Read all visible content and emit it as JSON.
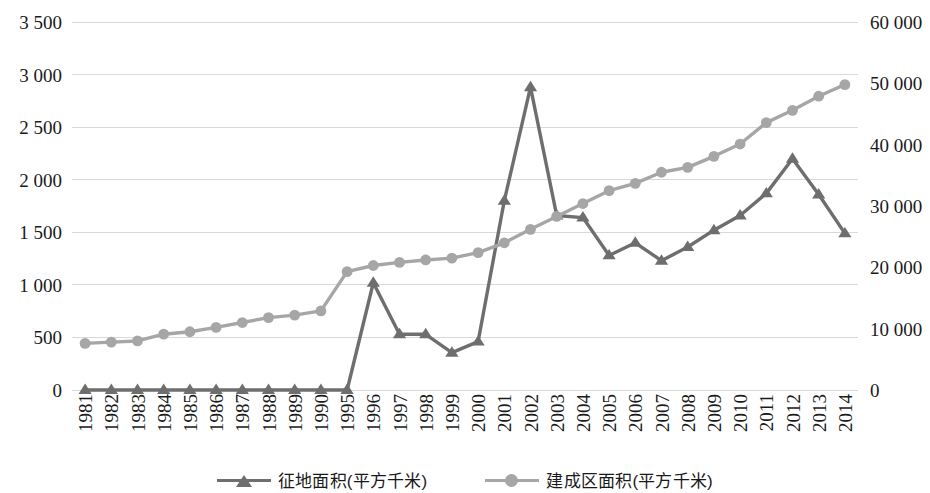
{
  "chart_data": {
    "type": "line",
    "title": "",
    "subtitle": "",
    "xlabel": "",
    "ylabel": "",
    "grid": true,
    "legend_position": "bottom",
    "categories": [
      "1981",
      "1982",
      "1983",
      "1984",
      "1985",
      "1986",
      "1987",
      "1988",
      "1989",
      "1990",
      "1995",
      "1996",
      "1997",
      "1998",
      "1999",
      "2000",
      "2001",
      "2002",
      "2003",
      "2004",
      "2005",
      "2006",
      "2007",
      "2008",
      "2009",
      "2010",
      "2011",
      "2012",
      "2013",
      "2014"
    ],
    "axes": {
      "left": {
        "ticks": [
          "0",
          "500",
          "1 000",
          "1 500",
          "2 000",
          "2 500",
          "3 000",
          "3 500"
        ],
        "tick_values": [
          0,
          500,
          1000,
          1500,
          2000,
          2500,
          3000,
          3500
        ],
        "min": 0,
        "max": 3500,
        "step": 500,
        "series_ref": "zhengdi"
      },
      "right": {
        "ticks": [
          "0",
          "10 000",
          "20 000",
          "30 000",
          "40 000",
          "50 000",
          "60 000"
        ],
        "tick_values": [
          0,
          10000,
          20000,
          30000,
          40000,
          50000,
          60000
        ],
        "min": 0,
        "max": 60000,
        "step": 10000,
        "series_ref": "jianchengqu"
      }
    },
    "series": [
      {
        "key": "zhengdi",
        "name": "征地面积(平方千米)",
        "axis": "left",
        "marker": "triangle",
        "color": "#6e6e6e",
        "values": [
          0,
          0,
          0,
          0,
          0,
          0,
          0,
          0,
          0,
          0,
          0,
          1020,
          530,
          530,
          355,
          460,
          1800,
          2880,
          1660,
          1640,
          1280,
          1400,
          1230,
          1360,
          1520,
          1660,
          1870,
          2200,
          1860,
          1490
        ]
      },
      {
        "key": "jianchengqu",
        "name": "建成区面积(平方千米)",
        "axis": "right",
        "marker": "circle",
        "color": "#a6a6a6",
        "values": [
          7600,
          7800,
          8000,
          9100,
          9500,
          10200,
          11000,
          11800,
          12200,
          12900,
          19300,
          20300,
          20800,
          21200,
          21500,
          22400,
          24000,
          26200,
          28300,
          30400,
          32500,
          33700,
          35500,
          36300,
          38100,
          40100,
          43600,
          45600,
          47900,
          49800
        ]
      }
    ],
    "marker_shapes": {
      "triangle": "triangle-marker",
      "circle": "circle-marker"
    },
    "colors": {
      "zhengdi": "#6e6e6e",
      "jianchengqu": "#a6a6a6",
      "gridline": "#d9d9d9",
      "background": "#ffffff",
      "text": "#1a1a1a"
    }
  },
  "legend": {
    "items": [
      {
        "label": "征地面积(平方千米)",
        "marker": "triangle-marker",
        "color": "#6e6e6e"
      },
      {
        "label": "建成区面积(平方千米)",
        "marker": "circle-marker",
        "color": "#a6a6a6"
      }
    ]
  }
}
